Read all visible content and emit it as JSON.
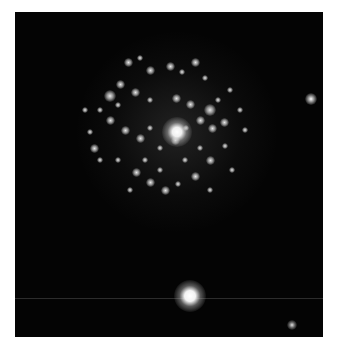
{
  "image": {
    "description": "Grayscale astronomical image of a face-on spiral galaxy with bright knots, a bright nucleus, and foreground stars",
    "background_color": "#040404",
    "border_color": "#ffffff",
    "galaxy": {
      "nucleus": {
        "x": 162,
        "y": 120,
        "radius": 9
      },
      "halo_radius": 95
    },
    "stars": [
      {
        "name": "bright-star-bottom",
        "x": 175,
        "y": 284,
        "radius": 10
      },
      {
        "name": "star-right",
        "x": 296,
        "y": 87,
        "radius": 3
      },
      {
        "name": "star-bottom-right",
        "x": 277,
        "y": 313,
        "radius": 3
      }
    ],
    "streak_y": 286,
    "knots": [
      [
        128,
        62,
        3
      ],
      [
        140,
        58,
        2
      ],
      [
        150,
        70,
        3
      ],
      [
        170,
        66,
        3
      ],
      [
        182,
        72,
        2
      ],
      [
        195,
        62,
        3
      ],
      [
        205,
        78,
        2
      ],
      [
        120,
        84,
        3
      ],
      [
        110,
        96,
        4
      ],
      [
        135,
        92,
        3
      ],
      [
        150,
        100,
        2
      ],
      [
        176,
        98,
        3
      ],
      [
        190,
        104,
        3
      ],
      [
        210,
        110,
        4
      ],
      [
        218,
        100,
        2
      ],
      [
        224,
        122,
        3
      ],
      [
        212,
        128,
        3
      ],
      [
        200,
        120,
        3
      ],
      [
        186,
        128,
        2
      ],
      [
        175,
        140,
        3
      ],
      [
        160,
        148,
        2
      ],
      [
        140,
        138,
        3
      ],
      [
        125,
        130,
        3
      ],
      [
        110,
        120,
        3
      ],
      [
        100,
        110,
        2
      ],
      [
        94,
        148,
        3
      ],
      [
        118,
        160,
        2
      ],
      [
        136,
        172,
        3
      ],
      [
        150,
        182,
        3
      ],
      [
        165,
        190,
        3
      ],
      [
        178,
        184,
        2
      ],
      [
        195,
        176,
        3
      ],
      [
        210,
        160,
        3
      ],
      [
        225,
        146,
        2
      ],
      [
        232,
        170,
        2
      ],
      [
        200,
        148,
        2
      ],
      [
        150,
        128,
        2
      ],
      [
        118,
        105,
        2
      ],
      [
        230,
        90,
        2
      ],
      [
        245,
        130,
        2
      ],
      [
        90,
        132,
        2
      ],
      [
        145,
        160,
        2
      ],
      [
        185,
        160,
        2
      ],
      [
        160,
        170,
        2
      ],
      [
        210,
        190,
        2
      ],
      [
        130,
        190,
        2
      ],
      [
        240,
        110,
        2
      ],
      [
        100,
        160,
        2
      ],
      [
        85,
        110,
        2
      ]
    ]
  }
}
